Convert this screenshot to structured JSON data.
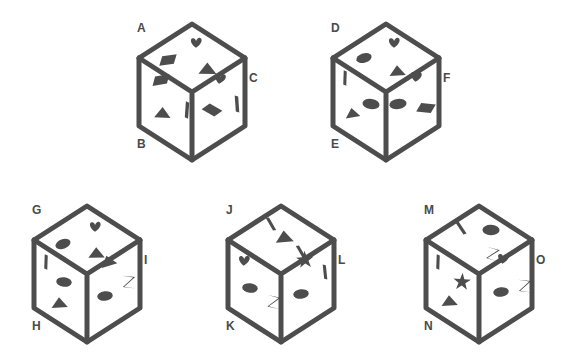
{
  "figure": {
    "background_color": "#ffffff",
    "ink_color": "#4d4d4d",
    "shape_color": "#4d4d4d",
    "label_color": "#4a4a4a",
    "stroke_width": 5
  },
  "cubes": [
    {
      "id": "cube-1",
      "x": 133,
      "y": 18,
      "labels": {
        "top_left": "A",
        "bottom_left": "B",
        "right": "C"
      },
      "faces": {
        "top": {
          "label": "A",
          "shapes": [
            "heart",
            "parallelogram",
            "triangle"
          ]
        },
        "left": {
          "label": "B",
          "shapes": [
            "parallelogram",
            "triangle",
            "bar"
          ]
        },
        "right": {
          "label": "C",
          "shapes": [
            "heart",
            "parallelogram",
            "bar"
          ]
        }
      }
    },
    {
      "id": "cube-2",
      "x": 327,
      "y": 18,
      "labels": {
        "top_left": "D",
        "bottom_left": "E",
        "right": "F"
      },
      "faces": {
        "top": {
          "label": "D",
          "shapes": [
            "heart",
            "ellipse",
            "triangle"
          ]
        },
        "left": {
          "label": "E",
          "shapes": [
            "bar",
            "ellipse",
            "triangle"
          ]
        },
        "right": {
          "label": "F",
          "shapes": [
            "heart",
            "ellipse",
            "parallelogram"
          ]
        }
      }
    },
    {
      "id": "cube-3",
      "x": 28,
      "y": 200,
      "labels": {
        "top_left": "G",
        "bottom_left": "H",
        "right": "I"
      },
      "faces": {
        "top": {
          "label": "G",
          "shapes": [
            "heart",
            "ellipse",
            "triangle"
          ]
        },
        "left": {
          "label": "H",
          "shapes": [
            "bar",
            "ellipse",
            "triangle"
          ]
        },
        "right": {
          "label": "I",
          "shapes": [
            "triangle",
            "bowtie",
            "ellipse"
          ]
        }
      }
    },
    {
      "id": "cube-4",
      "x": 222,
      "y": 200,
      "labels": {
        "top_left": "J",
        "bottom_left": "K",
        "right": "L"
      },
      "faces": {
        "top": {
          "label": "J",
          "shapes": [
            "bar",
            "triangle",
            "bar"
          ]
        },
        "left": {
          "label": "K",
          "shapes": [
            "heart",
            "ellipse",
            "bowtie"
          ]
        },
        "right": {
          "label": "L",
          "shapes": [
            "star",
            "bar",
            "ellipse"
          ]
        }
      }
    },
    {
      "id": "cube-5",
      "x": 420,
      "y": 200,
      "labels": {
        "top_left": "M",
        "bottom_left": "N",
        "right": "O"
      },
      "faces": {
        "top": {
          "label": "M",
          "shapes": [
            "bar",
            "ellipse",
            "bowtie"
          ]
        },
        "left": {
          "label": "N",
          "shapes": [
            "bar",
            "star",
            "triangle"
          ]
        },
        "right": {
          "label": "O",
          "shapes": [
            "heart",
            "ellipse",
            "bowtie"
          ]
        }
      }
    }
  ]
}
